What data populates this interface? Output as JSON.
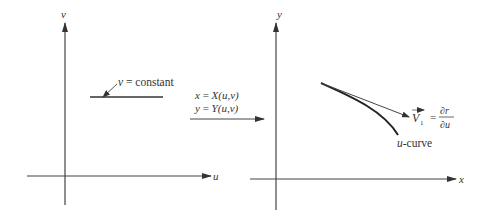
{
  "diagram": {
    "left_panel": {
      "vertical_axis_label": "v",
      "horizontal_axis_label": "u",
      "line_annotation": {
        "var": "v",
        "rest": " = constant"
      }
    },
    "mapping": {
      "line1": {
        "lhs": "x",
        "eq": " = ",
        "rhs": "X(u,v)"
      },
      "line2": {
        "lhs": "y",
        "eq": " = ",
        "rhs": "Y(u,v)"
      }
    },
    "right_panel": {
      "vertical_axis_label": "y",
      "horizontal_axis_label": "x",
      "vector_label": {
        "name": "V",
        "subscript": "1",
        "eq": "=",
        "numerator": "∂r",
        "denominator": "∂u"
      },
      "curve_label": {
        "var": "u",
        "rest": "-curve"
      }
    },
    "colors": {
      "ink": "#333333",
      "background": "#ffffff"
    }
  }
}
